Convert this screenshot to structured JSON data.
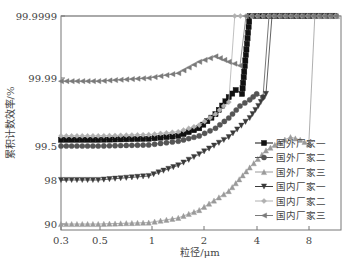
{
  "chart_data": {
    "type": "line",
    "title": "",
    "xlabel": "粒径/μm",
    "ylabel": "累积计数效率/%",
    "x_scale": "log",
    "y_scale": "probit",
    "x_ticks": [
      "0.3",
      "0.5",
      "1",
      "2",
      "4",
      "8"
    ],
    "y_ticks": [
      "90",
      "98",
      "99.5",
      "99.99",
      "99.9999"
    ],
    "xlim": [
      0.3,
      14
    ],
    "ylim": [
      90,
      99.9999
    ],
    "grid": false,
    "legend_position": "right-center",
    "series": [
      {
        "name": "国外厂家一",
        "marker": "square",
        "color": "#111111",
        "x": [
          0.3,
          0.5,
          1,
          1.5,
          2,
          2.5,
          3,
          3.3,
          3.6,
          4,
          14
        ],
        "y": [
          99.65,
          99.65,
          99.67,
          99.72,
          99.82,
          99.92,
          99.97,
          99.98,
          99.975,
          99.9999,
          99.9999
        ]
      },
      {
        "name": "国外厂家二",
        "marker": "circle",
        "color": "#555555",
        "x": [
          0.3,
          0.5,
          1,
          1.5,
          2,
          2.5,
          3,
          3.5,
          4,
          4.4,
          4.8,
          14
        ],
        "y": [
          99.5,
          99.5,
          99.53,
          99.62,
          99.72,
          99.82,
          99.9,
          99.95,
          99.965,
          99.975,
          99.97,
          99.9999
        ]
      },
      {
        "name": "国外厂家三",
        "marker": "triangle-up",
        "color": "#9a9a9a",
        "x": [
          0.3,
          0.5,
          1,
          1.5,
          2,
          3,
          4,
          5,
          6,
          7,
          8,
          9,
          14
        ],
        "y": [
          90.0,
          90.0,
          90.5,
          92,
          94,
          97,
          98.8,
          99.4,
          99.6,
          99.7,
          99.65,
          99.55,
          99.9999
        ]
      },
      {
        "name": "国内厂家一",
        "marker": "triangle-down",
        "color": "#3a3a3a",
        "x": [
          0.3,
          0.5,
          1,
          1.5,
          2,
          3,
          4,
          4.5,
          5,
          14
        ],
        "y": [
          98.0,
          98.0,
          98.3,
          98.9,
          99.3,
          99.7,
          99.9,
          99.95,
          99.975,
          99.9999
        ]
      },
      {
        "name": "国内厂家二",
        "marker": "diamond",
        "color": "#b0b0b0",
        "x": [
          0.3,
          0.5,
          1,
          1.5,
          2,
          2.5,
          2.8,
          3.0,
          14
        ],
        "y": [
          99.72,
          99.72,
          99.74,
          99.78,
          99.85,
          99.92,
          99.95,
          99.96,
          99.9999
        ]
      },
      {
        "name": "国内厂家三",
        "marker": "triangle-left",
        "color": "#7a7a7a",
        "x": [
          0.3,
          0.5,
          1,
          1.5,
          2,
          2.5,
          3,
          3.5,
          14
        ],
        "y": [
          99.988,
          99.988,
          99.99,
          99.993,
          99.997,
          99.998,
          99.997,
          99.996,
          99.9999
        ]
      }
    ]
  },
  "axes": {
    "xlabel": "粒径/μm",
    "ylabel": "累积计数效率/%",
    "x_ticks": [
      {
        "label": "0.3",
        "px": 61
      },
      {
        "label": "0.5",
        "px": 100
      },
      {
        "label": "1",
        "px": 152
      },
      {
        "label": "2",
        "px": 204
      },
      {
        "label": "4",
        "px": 257
      },
      {
        "label": "8",
        "px": 309
      }
    ],
    "y_ticks": [
      {
        "label": "99.9999",
        "py": 16
      },
      {
        "label": "99.99",
        "py": 78
      },
      {
        "label": "99.5",
        "py": 146
      },
      {
        "label": "98",
        "py": 180
      },
      {
        "label": "90",
        "py": 224
      }
    ]
  },
  "legend": [
    {
      "label": "国外厂家一",
      "marker": "square",
      "color": "#111111"
    },
    {
      "label": "国外厂家二",
      "marker": "circle",
      "color": "#555555"
    },
    {
      "label": "国外厂家三",
      "marker": "triangle-up",
      "color": "#9a9a9a"
    },
    {
      "label": "国内厂家一",
      "marker": "triangle-down",
      "color": "#3a3a3a"
    },
    {
      "label": "国内厂家二",
      "marker": "diamond",
      "color": "#b0b0b0"
    },
    {
      "label": "国内厂家三",
      "marker": "triangle-left",
      "color": "#7a7a7a"
    }
  ]
}
